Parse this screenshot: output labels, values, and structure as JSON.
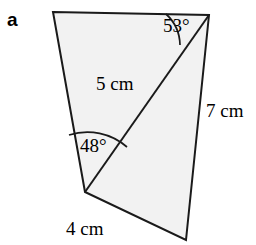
{
  "figure": {
    "part_label": "a",
    "shape": {
      "name": "quadrilateral-with-diagonal",
      "fill_color": "#f2f2f2",
      "stroke_color": "#1a1a1a",
      "vertices": {
        "top_left": [
          53,
          12
        ],
        "top_right": [
          209,
          15
        ],
        "bottom_right": [
          186,
          240
        ],
        "bottom_left": [
          85,
          192
        ]
      },
      "diagonal": {
        "from": "bottom_left",
        "to": "top_right"
      }
    },
    "side_labels": [
      {
        "name": "diagonal-length",
        "text": "5 cm"
      },
      {
        "name": "right-side-length",
        "text": "7 cm"
      },
      {
        "name": "bottom-side-length",
        "text": "4 cm"
      }
    ],
    "angle_labels": [
      {
        "name": "top-right-angle",
        "text": "53°"
      },
      {
        "name": "bottom-left-angle",
        "text": "48°"
      }
    ],
    "measurements": {
      "diagonal": "5 cm",
      "right_side": "7 cm",
      "bottom_side": "4 cm",
      "angle_top_right": "53°",
      "angle_bottom_left": "48°"
    }
  }
}
